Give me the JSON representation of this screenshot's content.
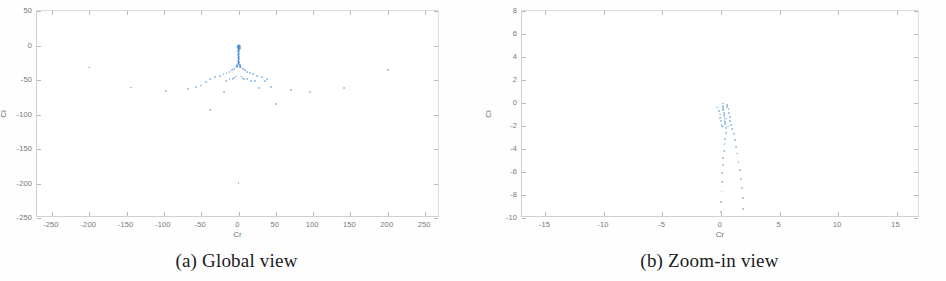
{
  "figure": {
    "accent_color": "#4a90d9",
    "axis_color": "#c8c8c8",
    "tick_text_color": "#787878",
    "caption_color": "#1b1b1b"
  },
  "panels": [
    {
      "id": "global-view",
      "caption": "(a) Global view",
      "chart": {
        "type": "scatter",
        "title": "",
        "xlabel": "Cr",
        "ylabel": "Ci",
        "xlim": [
          -270,
          270
        ],
        "ylim": [
          -250,
          50
        ],
        "xticks": [
          -250,
          -200,
          -150,
          -100,
          -50,
          0,
          50,
          100,
          150,
          200,
          250
        ],
        "xticklabels": [
          "-250",
          "-200",
          "-150",
          "-100",
          "-50",
          "0",
          "50",
          "100",
          "150",
          "200",
          "250"
        ],
        "yticks": [
          50,
          0,
          -50,
          -100,
          -150,
          -200,
          -250
        ],
        "yticklabels": [
          "50",
          "0",
          "-50",
          "-100",
          "-150",
          "-200",
          "-250"
        ],
        "grid": false,
        "legend": null,
        "marker": "dot",
        "color": "#4a90d9",
        "points": [
          [
            0,
            -0.5
          ],
          [
            0,
            -1.2
          ],
          [
            0,
            -2.0
          ],
          [
            0,
            -2.8
          ],
          [
            0,
            -3.6
          ],
          [
            0,
            -4.4
          ],
          [
            0,
            -5.2
          ],
          [
            0,
            -6.0
          ],
          [
            0,
            -6.8
          ],
          [
            0,
            -7.6
          ],
          [
            0,
            -8.4
          ],
          [
            0,
            -9.2
          ],
          [
            0,
            -10.0
          ],
          [
            0,
            -10.8
          ],
          [
            0,
            -11.6
          ],
          [
            0,
            -12.4
          ],
          [
            0,
            -13.2
          ],
          [
            0,
            -14.0
          ],
          [
            0,
            -14.8
          ],
          [
            0,
            -15.6
          ],
          [
            0,
            -16.4
          ],
          [
            0,
            -17.2
          ],
          [
            0,
            -18.0
          ],
          [
            0,
            -18.8
          ],
          [
            0,
            -19.6
          ],
          [
            0,
            -20.4
          ],
          [
            0,
            -21.2
          ],
          [
            0,
            -22.0
          ],
          [
            0,
            -22.8
          ],
          [
            0,
            -23.6
          ],
          [
            0,
            -24.4
          ],
          [
            0,
            -25.2
          ],
          [
            0,
            -26.0
          ],
          [
            0,
            -26.8
          ],
          [
            0,
            -27.6
          ],
          [
            0.8,
            -1.0
          ],
          [
            0.8,
            -4.0
          ],
          [
            0.8,
            -8.0
          ],
          [
            0.8,
            -12.0
          ],
          [
            0.8,
            -16.0
          ],
          [
            0.8,
            -20.0
          ],
          [
            0.8,
            -24.0
          ],
          [
            0.8,
            -27.0
          ],
          [
            -0.8,
            -2.0
          ],
          [
            -0.8,
            -6.0
          ],
          [
            -0.8,
            -10.0
          ],
          [
            -0.8,
            -14.0
          ],
          [
            -0.8,
            -18.0
          ],
          [
            -0.8,
            -22.0
          ],
          [
            -0.8,
            -26.0
          ],
          [
            -2,
            -30
          ],
          [
            -4,
            -32
          ],
          [
            -6,
            -34
          ],
          [
            -9,
            -36
          ],
          [
            -12,
            -38
          ],
          [
            -16,
            -40
          ],
          [
            -20,
            -42
          ],
          [
            -25,
            -44
          ],
          [
            -31,
            -46
          ],
          [
            -38,
            -48
          ],
          [
            2,
            -30
          ],
          [
            4,
            -32
          ],
          [
            6,
            -34
          ],
          [
            9,
            -36
          ],
          [
            12,
            -38
          ],
          [
            16,
            -40
          ],
          [
            20,
            -42
          ],
          [
            25,
            -44
          ],
          [
            31,
            -46
          ],
          [
            38,
            -48
          ],
          [
            -1.5,
            -31
          ],
          [
            -3,
            -45
          ],
          [
            -5.5,
            -47
          ],
          [
            -8,
            -49
          ],
          [
            1.5,
            -31
          ],
          [
            3,
            -45
          ],
          [
            5.5,
            -47
          ],
          [
            8,
            -49
          ],
          [
            -43,
            -53
          ],
          [
            -50,
            -58
          ],
          [
            -57,
            -60
          ],
          [
            -68,
            -63
          ],
          [
            -97,
            -66
          ],
          [
            -144,
            -61
          ],
          [
            -200,
            -32
          ],
          [
            -19,
            -67
          ],
          [
            -38,
            -94
          ],
          [
            27,
            -62
          ],
          [
            22,
            -52
          ],
          [
            35,
            -52
          ],
          [
            44,
            -60
          ],
          [
            50,
            -85
          ],
          [
            71,
            -64
          ],
          [
            96,
            -68
          ],
          [
            141,
            -62
          ],
          [
            200,
            -35
          ],
          [
            0,
            -199
          ],
          [
            12,
            -49
          ],
          [
            17,
            -52
          ],
          [
            -12,
            -49
          ],
          [
            -17,
            -52
          ],
          [
            1.6,
            -28.5
          ],
          [
            -1.6,
            -28.5
          ],
          [
            2.4,
            -29.3
          ],
          [
            -2.4,
            -29.3
          ]
        ]
      }
    },
    {
      "id": "zoom-in-view",
      "caption": "(b) Zoom-in view",
      "chart": {
        "type": "scatter",
        "title": "",
        "xlabel": "Cr",
        "ylabel": "Ci",
        "xlim": [
          -17,
          17
        ],
        "ylim": [
          -10,
          8
        ],
        "xticks": [
          -15,
          -10,
          -5,
          0,
          5,
          10,
          15
        ],
        "xticklabels": [
          "-15",
          "-10",
          "-5",
          "0",
          "5",
          "10",
          "15"
        ],
        "yticks": [
          8,
          6,
          4,
          2,
          0,
          -2,
          -4,
          -6,
          -8,
          -10
        ],
        "yticklabels": [
          "8",
          "6",
          "4",
          "2",
          "0",
          "-2",
          "-4",
          "-6",
          "-8",
          "-10"
        ],
        "grid": false,
        "legend": null,
        "marker": "dot",
        "color": "#4a90d9",
        "points": [
          [
            0.15,
            -0.05
          ],
          [
            0.15,
            -0.25
          ],
          [
            0.2,
            -0.45
          ],
          [
            0.2,
            -0.65
          ],
          [
            0.25,
            -0.85
          ],
          [
            0.25,
            -1.05
          ],
          [
            0.3,
            -1.25
          ],
          [
            0.3,
            -1.45
          ],
          [
            0.35,
            -1.65
          ],
          [
            0.35,
            -1.85
          ],
          [
            -0.35,
            -0.4
          ],
          [
            -0.2,
            -0.7
          ],
          [
            -0.1,
            -1.0
          ],
          [
            -0.05,
            -1.3
          ],
          [
            0.0,
            -1.6
          ],
          [
            0.05,
            -1.9
          ],
          [
            0.65,
            -0.5
          ],
          [
            0.7,
            -0.85
          ],
          [
            0.75,
            -1.2
          ],
          [
            0.8,
            -1.55
          ],
          [
            0.85,
            -1.9
          ],
          [
            0.95,
            -2.3
          ],
          [
            0.45,
            -2.2
          ],
          [
            0.4,
            -2.6
          ],
          [
            0.35,
            -3.1
          ],
          [
            0.3,
            -3.6
          ],
          [
            0.25,
            -4.2
          ],
          [
            0.2,
            -4.8
          ],
          [
            0.15,
            -5.4
          ],
          [
            0.12,
            -6.1
          ],
          [
            0.08,
            -6.9
          ],
          [
            0.05,
            -7.7
          ],
          [
            0.02,
            -8.6
          ],
          [
            0.0,
            -9.5
          ],
          [
            1.1,
            -2.7
          ],
          [
            1.2,
            -3.2
          ],
          [
            1.3,
            -3.8
          ],
          [
            1.4,
            -4.4
          ],
          [
            1.5,
            -5.1
          ],
          [
            1.6,
            -5.8
          ],
          [
            1.7,
            -6.6
          ],
          [
            1.8,
            -7.4
          ],
          [
            1.85,
            -8.3
          ],
          [
            1.9,
            -9.2
          ],
          [
            0.5,
            -0.15
          ],
          [
            0.55,
            -0.35
          ],
          [
            0.1,
            -2.05
          ],
          [
            0.2,
            -2.05
          ],
          [
            0.6,
            -2.05
          ],
          [
            0.45,
            -1.35
          ]
        ]
      }
    }
  ]
}
